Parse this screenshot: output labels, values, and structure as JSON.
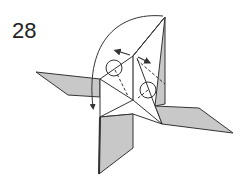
{
  "diagram": {
    "step_number": "28",
    "colors": {
      "paper_back": "#c8c8c8",
      "paper_front": "#ffffff",
      "line": "#333333"
    },
    "annotations": [
      {
        "type": "curved-arrow",
        "description": "large rotation arrow from top, curving left and down"
      },
      {
        "type": "double-arrow",
        "description": "small arrows pointing outward from center ridge"
      },
      {
        "type": "circle-marker",
        "count": 2
      },
      {
        "type": "dashed-line",
        "description": "valley fold lines"
      }
    ]
  }
}
